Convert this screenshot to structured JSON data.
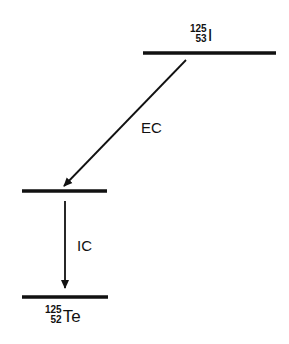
{
  "diagram": {
    "type": "nuclear-decay-scheme",
    "parent": {
      "mass_number": "125",
      "atomic_number": "53",
      "symbol": "I"
    },
    "daughter": {
      "mass_number": "125",
      "atomic_number": "52",
      "symbol": "Te"
    },
    "transitions": [
      {
        "label": "EC",
        "from": "parent-level",
        "to": "excited-level"
      },
      {
        "label": "IC",
        "from": "excited-level",
        "to": "ground-level"
      }
    ],
    "colors": {
      "line": "#111111",
      "background": "#ffffff"
    }
  }
}
